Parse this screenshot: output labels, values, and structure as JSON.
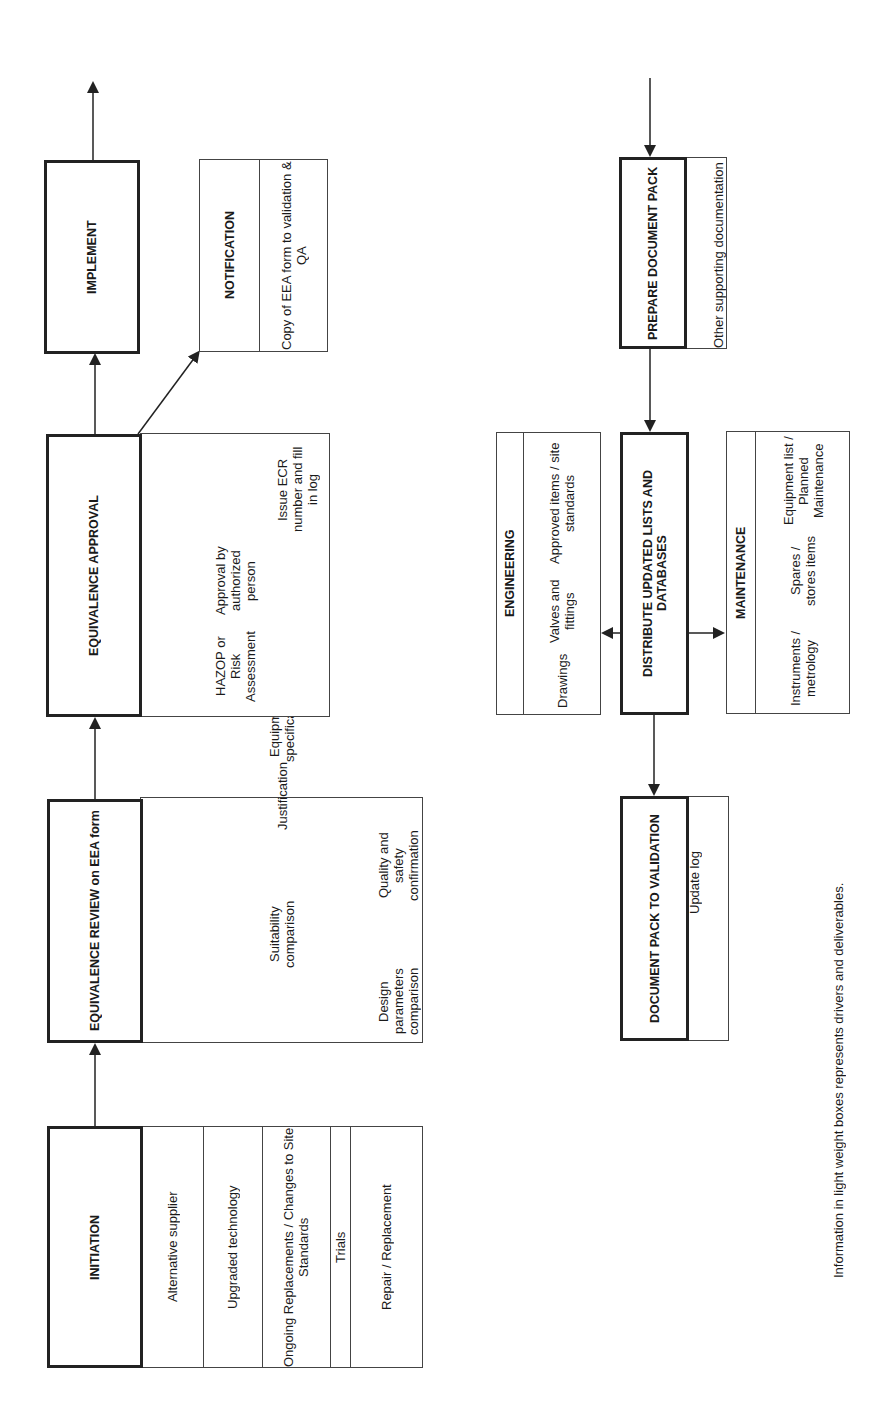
{
  "initiation": {
    "title": "INITIATION",
    "items": [
      "Alternative supplier",
      "Upgraded technology",
      "Ongoing Replacements / Changes to Site Standards",
      "Trials",
      "Repair / Replacement"
    ]
  },
  "review": {
    "title": "EQUIVALENCE REVIEW on EEA form",
    "items": [
      "Design parameters comparison",
      "Suitability comparison",
      "Quality and safety confirmation",
      "Justification",
      "Equipment specification"
    ]
  },
  "approval": {
    "title": "EQUIVALENCE APPROVAL",
    "items": [
      "HAZOP or Risk Assessment",
      "Approval by authorized person",
      "Issue ECR number and fill in log"
    ]
  },
  "implement": {
    "title": "IMPLEMENT"
  },
  "notification": {
    "title": "NOTIFICATION",
    "items": [
      "Copy of EEA form to validation & QA"
    ]
  },
  "prepare": {
    "title": "PREPARE DOCUMENT PACK",
    "items": [
      "Other supporting documentation"
    ]
  },
  "distribute": {
    "title": "DISTRIBUTE UPDATED LISTS AND DATABASES"
  },
  "engineering": {
    "title": "ENGINEERING",
    "items": [
      "Drawings",
      "Valves and fittings",
      "Approved items / site standards"
    ]
  },
  "maintenance": {
    "title": "MAINTENANCE",
    "items": [
      "Instruments / metrology",
      "Spares / stores items",
      "Equipment list / Planned Maintenance"
    ]
  },
  "validation": {
    "title": "DOCUMENT PACK TO VALIDATION",
    "items": [
      "Update log"
    ]
  },
  "footnote": "Information in light weight boxes represents drivers and deliverables.",
  "colors": {
    "line": "#222222",
    "background": "#ffffff"
  }
}
